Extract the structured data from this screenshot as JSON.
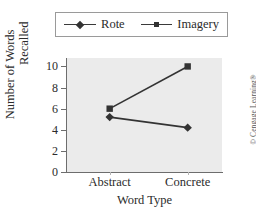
{
  "chart_data": {
    "type": "line",
    "title": "",
    "xlabel": "Word Type",
    "ylabel_line1": "Number of Words",
    "ylabel_line2": "Recalled",
    "categories": [
      "Abstract",
      "Concrete"
    ],
    "ylim": [
      0,
      10.8
    ],
    "yticks": [
      0,
      2,
      4,
      6,
      8,
      10
    ],
    "ytick_labels": [
      "0",
      "2",
      "4",
      "6",
      "8",
      "10"
    ],
    "grid": false,
    "legend_position": "above-center",
    "series": [
      {
        "name": "Rote",
        "marker": "diamond",
        "color": "#333333",
        "values": [
          5.2,
          4.2
        ]
      },
      {
        "name": "Imagery",
        "marker": "square",
        "color": "#333333",
        "values": [
          6.0,
          10.0
        ]
      }
    ]
  },
  "legend": {
    "entries": [
      {
        "label": "Rote",
        "marker": "diamond-marker"
      },
      {
        "label": "Imagery",
        "marker": "square-marker"
      }
    ]
  },
  "credit": {
    "text": "© Cengage Learning®"
  }
}
